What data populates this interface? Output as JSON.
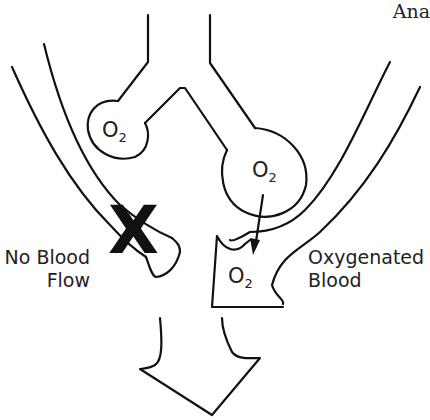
{
  "header": {
    "text": "Ana"
  },
  "labels": {
    "no_blood_flow_line1": "No Blood",
    "no_blood_flow_line2": "Flow",
    "oxygenated_line1": "Oxygenated",
    "oxygenated_line2": "Blood"
  },
  "molecules": {
    "small_alveolus": {
      "symbol": "O",
      "subscript": "2"
    },
    "large_alveolus": {
      "symbol": "O",
      "subscript": "2"
    },
    "vessel": {
      "symbol": "O",
      "subscript": "2"
    }
  },
  "marks": {
    "blocked": "X"
  },
  "icons": {
    "blocked": "x-mark-icon",
    "diffusion": "arrow-down-icon",
    "flow": "large-down-arrow-icon"
  },
  "colors": {
    "stroke": "#111111",
    "text": "#222222",
    "background": "#ffffff"
  }
}
